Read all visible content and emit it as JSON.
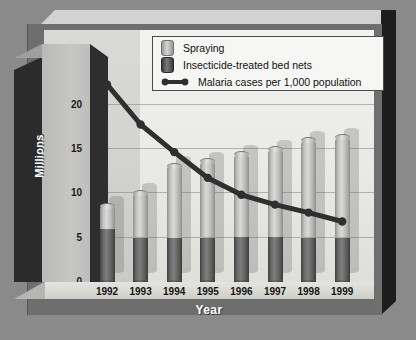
{
  "chart_data": {
    "type": "bar",
    "title": "",
    "subtitle": "",
    "xlabel": "Year",
    "ylabel": "Millions",
    "categories": [
      "1992",
      "1993",
      "1994",
      "1995",
      "1996",
      "1997",
      "1998",
      "1999"
    ],
    "ylim": [
      0,
      22
    ],
    "yticks": [
      "0",
      "5",
      "10",
      "15",
      "20"
    ],
    "ytick_values": [
      0,
      5,
      10,
      15,
      20
    ],
    "grid": true,
    "legend_position": "top-right",
    "stacked": true,
    "series": [
      {
        "name": "Insecticide-treated bed nets",
        "type": "bar",
        "color": "#5d5d5d",
        "values": [
          6.0,
          5.0,
          4.9,
          5.0,
          5.1,
          5.1,
          5.0,
          5.0
        ]
      },
      {
        "name": "Spraying",
        "type": "bar",
        "color": "#c9c9c7",
        "values": [
          2.6,
          5.1,
          8.2,
          8.6,
          9.3,
          9.9,
          11.0,
          11.3
        ]
      },
      {
        "name": "Malaria cases per 1,000 population",
        "type": "line",
        "color": "#2f2f2f",
        "values": [
          22.2,
          17.7,
          14.6,
          11.7,
          9.8,
          8.7,
          7.8,
          6.8
        ]
      }
    ],
    "bar_totals": [
      8.6,
      10.1,
      13.1,
      13.6,
      14.4,
      15.0,
      16.0,
      16.3
    ]
  },
  "legend": {
    "items": [
      {
        "label": "Spraying",
        "icon": "cylinder-light-swatch"
      },
      {
        "label": "Insecticide-treated bed nets",
        "icon": "cylinder-dark-swatch"
      },
      {
        "label": "Malaria cases per 1,000 population",
        "icon": "line-marker-swatch"
      }
    ]
  },
  "axes": {
    "y_title": "Millions",
    "x_title": "Year"
  },
  "colors": {
    "background": "#8a8a8a",
    "panel": "#eeeeec",
    "spraying": "#c9c9c7",
    "bed_nets": "#5d5d5d",
    "line": "#2f2f2f",
    "frame": "#6e6e6e"
  }
}
